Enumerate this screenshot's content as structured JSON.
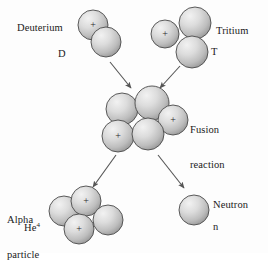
{
  "diagram": {
    "background_color": "#fdfdfd",
    "sphere_fill_light": "#e8e8e8",
    "sphere_fill_dark": "#9a9a9a",
    "outline_color": "#4a4a4a",
    "arrow_color": "#555555",
    "text_color": "#1a1a1a"
  },
  "labels": {
    "deuterium": "Deuterium",
    "deuterium_symbol": "D",
    "tritium": "Tritium",
    "tritium_symbol": "T",
    "fusion_line1": "Fusion",
    "fusion_line2": "reaction",
    "alpha_line1": "Alpha",
    "alpha_line2": "particle",
    "alpha_symbol": "He",
    "alpha_symbol_superscript": "4",
    "neutron": "Neutron",
    "neutron_symbol": "n",
    "proton_charge": "+"
  },
  "groups": [
    {
      "name": "deuterium",
      "label": "Deuterium",
      "symbol": "D",
      "particle_count": 2,
      "proton_count": 1,
      "spheres": [
        {
          "cx": 93,
          "cy": 25,
          "r": 15,
          "charge": "+"
        },
        {
          "cx": 106,
          "cy": 42,
          "r": 15,
          "charge": ""
        }
      ]
    },
    {
      "name": "tritium",
      "label": "Tritium",
      "symbol": "T",
      "particle_count": 3,
      "proton_count": 1,
      "spheres": [
        {
          "cx": 165,
          "cy": 34,
          "r": 14,
          "charge": "+"
        },
        {
          "cx": 195,
          "cy": 23,
          "r": 16,
          "charge": ""
        },
        {
          "cx": 192,
          "cy": 52,
          "r": 16,
          "charge": ""
        }
      ]
    },
    {
      "name": "fusion-reaction",
      "label": "Fusion reaction",
      "symbol": "",
      "particle_count": 5,
      "proton_count": 2,
      "spheres": [
        {
          "cx": 122,
          "cy": 109,
          "r": 16,
          "charge": ""
        },
        {
          "cx": 152,
          "cy": 103,
          "r": 17,
          "charge": ""
        },
        {
          "cx": 173,
          "cy": 120,
          "r": 15,
          "charge": "+"
        },
        {
          "cx": 118,
          "cy": 136,
          "r": 16,
          "charge": "+"
        },
        {
          "cx": 148,
          "cy": 134,
          "r": 16,
          "charge": ""
        }
      ]
    },
    {
      "name": "alpha-particle",
      "label": "Alpha particle",
      "symbol": "He4",
      "particle_count": 4,
      "proton_count": 2,
      "spheres": [
        {
          "cx": 64,
          "cy": 211,
          "r": 15,
          "charge": ""
        },
        {
          "cx": 86,
          "cy": 201,
          "r": 15,
          "charge": "+"
        },
        {
          "cx": 108,
          "cy": 220,
          "r": 15,
          "charge": ""
        },
        {
          "cx": 79,
          "cy": 229,
          "r": 15,
          "charge": "+"
        }
      ]
    },
    {
      "name": "neutron",
      "label": "Neutron",
      "symbol": "n",
      "particle_count": 1,
      "proton_count": 0,
      "spheres": [
        {
          "cx": 194,
          "cy": 210,
          "r": 15,
          "charge": ""
        }
      ]
    }
  ],
  "arrows": [
    {
      "name": "arrow-deuterium-to-fusion",
      "x1": 110,
      "y1": 62,
      "x2": 131,
      "y2": 88
    },
    {
      "name": "arrow-tritium-to-fusion",
      "x1": 180,
      "y1": 66,
      "x2": 160,
      "y2": 88
    },
    {
      "name": "arrow-fusion-to-alpha",
      "x1": 116,
      "y1": 155,
      "x2": 93,
      "y2": 187
    },
    {
      "name": "arrow-fusion-to-neutron",
      "x1": 158,
      "y1": 155,
      "x2": 184,
      "y2": 188
    }
  ]
}
